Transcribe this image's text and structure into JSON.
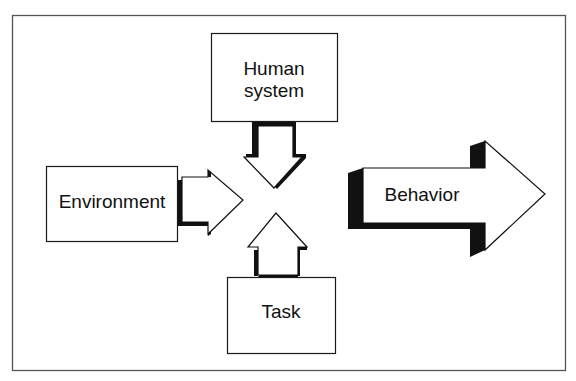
{
  "diagram": {
    "frame": {
      "stroke": "#555555"
    },
    "nodes": {
      "human_system": {
        "line1": "Human",
        "line2": "system"
      },
      "environment": {
        "label": "Environment"
      },
      "task": {
        "label": "Task"
      },
      "behavior": {
        "label": "Behavior"
      }
    },
    "edges": [
      {
        "from": "Human system",
        "to": "center",
        "direction": "down"
      },
      {
        "from": "Environment",
        "to": "center",
        "direction": "right"
      },
      {
        "from": "Task",
        "to": "center",
        "direction": "up"
      },
      {
        "from": "center",
        "to": "Behavior",
        "direction": "right"
      }
    ],
    "colors": {
      "line": "#1a1a1a",
      "fill": "#ffffff",
      "shadow": "#111111"
    }
  }
}
